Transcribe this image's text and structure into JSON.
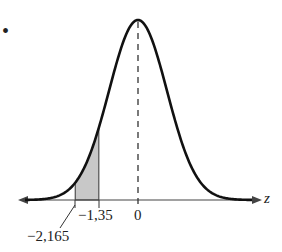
{
  "figure": {
    "bullet": "•",
    "axis_label": "z",
    "ticks": [
      {
        "value": -2.165,
        "label": "−2,165"
      },
      {
        "value": -1.35,
        "label": "−1,35"
      },
      {
        "value": 0,
        "label": "0"
      }
    ],
    "shaded_region": {
      "from": -2.165,
      "to": -1.35,
      "fill": "#c8c8c8"
    },
    "curve": "standard normal density",
    "mean_line": "dashed vertical line at z = 0",
    "colors": {
      "curve": "#111111",
      "axis": "#333333",
      "shade": "#c8c8c8"
    }
  }
}
